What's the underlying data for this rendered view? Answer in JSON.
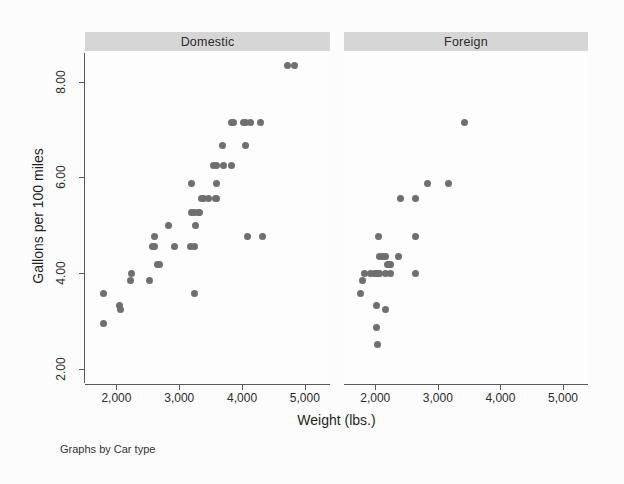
{
  "caption": "Graphs by Car type",
  "axes": {
    "xtitle": "Weight (lbs.)",
    "ytitle": "Gallons per 100 miles"
  },
  "panels": [
    {
      "key": "domestic",
      "label": "Domestic"
    },
    {
      "key": "foreign",
      "label": "Foreign"
    }
  ],
  "ticks": {
    "x": [
      "2,000",
      "3,000",
      "4,000",
      "5,000"
    ],
    "y": [
      "2.00",
      "4.00",
      "6.00",
      "8.00"
    ]
  },
  "colors": {
    "marker": "#6f6f6f",
    "strip": "#d6d6d6",
    "axis": "#5a5a5a",
    "background": "#fcfcfc"
  },
  "chart_data": {
    "type": "scatter",
    "title": "",
    "xlabel": "Weight (lbs.)",
    "ylabel": "Gallons per 100 miles",
    "xlim": [
      1500,
      5400
    ],
    "ylim": [
      1.7,
      8.6
    ],
    "xticks": [
      2000,
      3000,
      4000,
      5000
    ],
    "yticks": [
      2.0,
      4.0,
      6.0,
      8.0
    ],
    "xtick_labels": [
      "2,000",
      "3,000",
      "4,000",
      "5,000"
    ],
    "ytick_labels": [
      "2.00",
      "4.00",
      "6.00",
      "8.00"
    ],
    "grid": false,
    "legend": "none",
    "facet_by": "Car type",
    "facet_note": "Graphs by Car type",
    "marker_color": "#6f6f6f",
    "series": [
      {
        "name": "Domestic",
        "points": [
          [
            1800,
            3.57
          ],
          [
            1800,
            2.94
          ],
          [
            2050,
            3.33
          ],
          [
            2060,
            3.23
          ],
          [
            2240,
            4.0
          ],
          [
            2230,
            3.85
          ],
          [
            2520,
            3.85
          ],
          [
            2580,
            4.55
          ],
          [
            2600,
            4.76
          ],
          [
            2600,
            4.55
          ],
          [
            2650,
            4.17
          ],
          [
            2690,
            4.17
          ],
          [
            2830,
            5.0
          ],
          [
            2930,
            4.55
          ],
          [
            3180,
            4.55
          ],
          [
            3250,
            4.55
          ],
          [
            3200,
            5.26
          ],
          [
            3250,
            5.26
          ],
          [
            3300,
            5.26
          ],
          [
            3330,
            5.26
          ],
          [
            3260,
            5.0
          ],
          [
            3250,
            3.57
          ],
          [
            3350,
            5.56
          ],
          [
            3380,
            5.56
          ],
          [
            3470,
            5.56
          ],
          [
            3570,
            5.56
          ],
          [
            3600,
            5.56
          ],
          [
            3200,
            5.88
          ],
          [
            3600,
            5.88
          ],
          [
            3540,
            6.25
          ],
          [
            3600,
            6.25
          ],
          [
            3700,
            6.25
          ],
          [
            3830,
            6.25
          ],
          [
            3690,
            6.67
          ],
          [
            4060,
            6.67
          ],
          [
            3830,
            7.14
          ],
          [
            3870,
            7.14
          ],
          [
            4030,
            7.14
          ],
          [
            4060,
            7.14
          ],
          [
            4130,
            7.14
          ],
          [
            4290,
            7.14
          ],
          [
            4080,
            4.76
          ],
          [
            4330,
            4.76
          ],
          [
            4720,
            8.33
          ],
          [
            4840,
            8.33
          ]
        ]
      },
      {
        "name": "Foreign",
        "points": [
          [
            1760,
            3.57
          ],
          [
            1800,
            3.85
          ],
          [
            1830,
            4.0
          ],
          [
            1930,
            4.0
          ],
          [
            1990,
            4.0
          ],
          [
            2020,
            4.0
          ],
          [
            2070,
            4.35
          ],
          [
            2110,
            4.35
          ],
          [
            2160,
            4.35
          ],
          [
            2240,
            4.0
          ],
          [
            2200,
            4.17
          ],
          [
            2230,
            4.17
          ],
          [
            2370,
            4.35
          ],
          [
            2050,
            4.76
          ],
          [
            2650,
            4.76
          ],
          [
            2020,
            3.33
          ],
          [
            2160,
            3.23
          ],
          [
            2020,
            2.86
          ],
          [
            2040,
            2.5
          ],
          [
            2070,
            4.0
          ],
          [
            2160,
            4.0
          ],
          [
            2650,
            4.0
          ],
          [
            2400,
            5.56
          ],
          [
            2650,
            5.56
          ],
          [
            2830,
            5.88
          ],
          [
            3170,
            5.88
          ],
          [
            3420,
            7.14
          ],
          [
            2240,
            4.17
          ],
          [
            2050,
            4.0
          ]
        ]
      }
    ]
  }
}
